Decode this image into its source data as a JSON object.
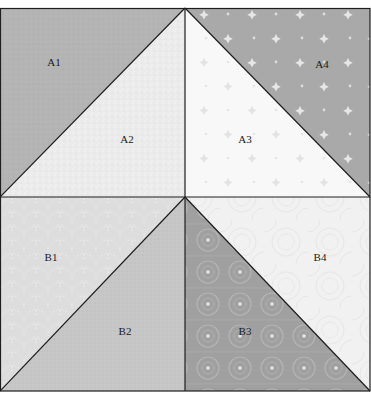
{
  "diagram": {
    "type": "quilt-block",
    "units": [
      {
        "id": "A-left",
        "patches": [
          {
            "label": "A1",
            "fill": "#b4b4b4",
            "pattern": "solid-tonal"
          },
          {
            "label": "A2",
            "fill": "#ebebeb",
            "pattern": "speckle"
          }
        ]
      },
      {
        "id": "A-right",
        "patches": [
          {
            "label": "A3",
            "fill": "#f8f8f8",
            "pattern": "faint-stars"
          },
          {
            "label": "A4",
            "fill": "#a9a9a9",
            "pattern": "white-stars"
          }
        ]
      },
      {
        "id": "B-left",
        "patches": [
          {
            "label": "B1",
            "fill": "#dddddd",
            "pattern": "scallops"
          },
          {
            "label": "B2",
            "fill": "#c6c6c6",
            "pattern": "fine-texture"
          }
        ]
      },
      {
        "id": "B-right",
        "patches": [
          {
            "label": "B3",
            "fill": "#a0a0a0",
            "pattern": "circles"
          },
          {
            "label": "B4",
            "fill": "#f1f1f1",
            "pattern": "swirls"
          }
        ]
      }
    ],
    "colors": {
      "outline": "#1e1e1e",
      "background": "#ffffff",
      "label": "#1a1a1a"
    }
  },
  "labels": {
    "a1": "A1",
    "a2": "A2",
    "a3": "A3",
    "a4": "A4",
    "b1": "B1",
    "b2": "B2",
    "b3": "B3",
    "b4": "B4"
  }
}
